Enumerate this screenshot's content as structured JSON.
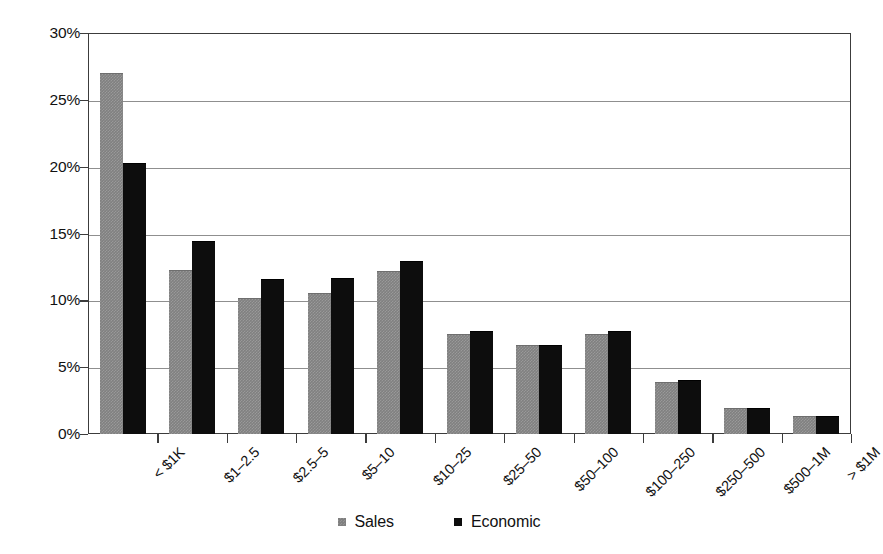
{
  "chart_data": {
    "type": "bar",
    "title": "",
    "subtitle": "",
    "xlabel": "",
    "ylabel": "",
    "ylim": [
      0,
      30
    ],
    "ytick_values": [
      0,
      5,
      10,
      15,
      20,
      25,
      30
    ],
    "ytick_labels": [
      "0%",
      "5%",
      "10%",
      "15%",
      "20%",
      "25%",
      "30%"
    ],
    "grid": true,
    "legend_position": "bottom-center",
    "value_unit": "percent",
    "categories": [
      "< $1K",
      "$1–2.5",
      "$2.5–5",
      "$5–10",
      "$10–25",
      "$25–50",
      "$50–100",
      "$100–250",
      "$250–500",
      "$500–1M",
      "> $1M"
    ],
    "series": [
      {
        "name": "Sales",
        "color": "#808080",
        "values": [
          26.9,
          12.2,
          10.1,
          10.5,
          12.1,
          7.4,
          6.6,
          7.4,
          3.8,
          1.9,
          1.3
        ]
      },
      {
        "name": "Economic",
        "color": "#0d0d0d",
        "values": [
          20.2,
          14.4,
          11.5,
          11.6,
          12.9,
          7.6,
          6.6,
          7.6,
          4.0,
          1.9,
          1.3
        ]
      }
    ]
  },
  "legend": {
    "items": [
      {
        "label": "Sales"
      },
      {
        "label": "Economic"
      }
    ]
  }
}
